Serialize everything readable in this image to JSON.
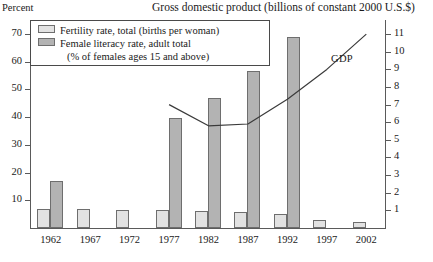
{
  "axis_left_title": "Percent",
  "chart_title": "Gross domestic product (billions of constant 2000 U.S.$)",
  "legend": {
    "fertility_label": "Fertility rate, total (births per woman)",
    "literacy_label": "Female literacy rate, adult total",
    "literacy_label_2": "(% of females ages 15 and above)",
    "fertility_swatch_color": "#e2e2e2",
    "literacy_swatch_color": "#b3b3b3"
  },
  "gdp_series_label": "GDP",
  "chart_data": {
    "type": "bar",
    "title": "Gross domestic product (billions of constant 2000 U.S.$)",
    "xlabel": "",
    "ylabel": "Percent",
    "y2label": "Gross domestic product (billions of constant 2000 U.S.$)",
    "ylim": [
      0,
      75
    ],
    "y2lim": [
      0,
      11.8
    ],
    "yticks": [
      10,
      20,
      30,
      40,
      50,
      60,
      70
    ],
    "y2ticks": [
      1,
      2,
      3,
      4,
      5,
      6,
      7,
      8,
      9,
      10,
      11
    ],
    "grid": false,
    "legend_position": "top-left",
    "categories": [
      "1962",
      "1967",
      "1972",
      "1977",
      "1982",
      "1987",
      "1992",
      "1997",
      "2002"
    ],
    "series": [
      {
        "name": "Fertility rate, total (births per woman)",
        "axis": "left",
        "unit": "percent-scaled",
        "color": "#e2e2e2",
        "values": [
          7.0,
          6.9,
          6.5,
          6.4,
          6.3,
          5.8,
          4.9,
          3.0,
          2.0
        ]
      },
      {
        "name": "Female literacy rate, adult total (% of females ages 15 and above)",
        "axis": "left",
        "unit": "percent",
        "color": "#b3b3b3",
        "values": [
          17,
          null,
          null,
          39.5,
          47,
          56.5,
          69,
          null,
          null
        ]
      },
      {
        "name": "GDP",
        "type": "line",
        "axis": "right",
        "unit": "billions of constant 2000 U.S.$",
        "color": "#3a3a3a",
        "x": [
          "1977",
          "1982",
          "1987",
          "1992",
          "1997",
          "2002"
        ],
        "values": [
          7.0,
          5.8,
          5.9,
          7.3,
          9.0,
          11.0
        ]
      }
    ]
  },
  "ticks_left": [
    "70",
    "60",
    "50",
    "40",
    "30",
    "20",
    "10"
  ],
  "ticks_right": [
    "11",
    "10",
    "9",
    "8",
    "7",
    "6",
    "5",
    "4",
    "3",
    "2",
    "1"
  ],
  "xlabels": [
    "1962",
    "1967",
    "1972",
    "1977",
    "1982",
    "1987",
    "1992",
    "1997",
    "2002"
  ]
}
